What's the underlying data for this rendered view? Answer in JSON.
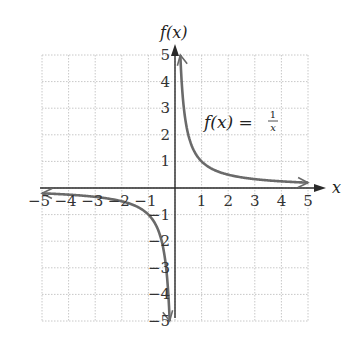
{
  "chart_data": {
    "type": "line",
    "title": "",
    "xlabel": "x",
    "ylabel": "f(x)",
    "xlim": [
      -5,
      5
    ],
    "ylim": [
      -5,
      5
    ],
    "grid": true,
    "x_ticks": [
      "-5",
      "-4",
      "-3",
      "-2",
      "-1",
      "1",
      "2",
      "3",
      "4",
      "5"
    ],
    "y_ticks": [
      "-5",
      "-4",
      "-3",
      "-2",
      "-1",
      "1",
      "2",
      "3",
      "4",
      "5"
    ],
    "annotation": {
      "text": "f(x) = 1/x",
      "lhs": "f(x) =",
      "num": "1",
      "den": "x"
    },
    "series": [
      {
        "name": "f(x) = 1/x (x > 0)",
        "x": [
          0.2,
          0.25,
          0.33,
          0.5,
          1,
          2,
          3,
          4,
          5
        ],
        "y": [
          5,
          4,
          3,
          2,
          1,
          0.5,
          0.333,
          0.25,
          0.2
        ]
      },
      {
        "name": "f(x) = 1/x (x < 0)",
        "x": [
          -5,
          -4,
          -3,
          -2,
          -1,
          -0.5,
          -0.33,
          -0.25,
          -0.2
        ],
        "y": [
          -0.2,
          -0.25,
          -0.333,
          -0.5,
          -1,
          -2,
          -3,
          -4,
          -5
        ]
      }
    ],
    "colors": {
      "curve": "#6a6a6a",
      "axis": "#2a2a2a",
      "grid": "#c8c8c8"
    }
  }
}
